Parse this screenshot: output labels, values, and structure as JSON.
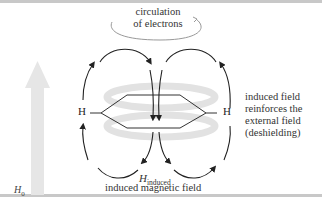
{
  "diagram": {
    "labels": {
      "circulation": [
        "circulation",
        "of electrons"
      ],
      "h_left": "H",
      "h_right": "H",
      "right_note": [
        "induced field",
        "reinforces the",
        "external field",
        "(deshielding)"
      ],
      "h_induced_main": "H",
      "h_induced_sub": "induced",
      "induced_field_caption": "induced magnetic field",
      "h0_main": "H",
      "h0_sub": "0"
    },
    "colors": {
      "arrow_big": "#e6e6e6",
      "field_lines": "#222222",
      "ring_shadow": "#e2e2e2",
      "rule": "#c8c8c8"
    }
  }
}
